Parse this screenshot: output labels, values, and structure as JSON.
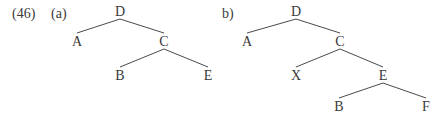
{
  "example": {
    "number": "(46)",
    "panels": [
      {
        "label": "(a)",
        "nodes": [
          {
            "id": "D",
            "label": "D",
            "x": 120,
            "y": 16
          },
          {
            "id": "A",
            "label": "A",
            "x": 77,
            "y": 46
          },
          {
            "id": "C",
            "label": "C",
            "x": 164,
            "y": 46
          },
          {
            "id": "B",
            "label": "B",
            "x": 120,
            "y": 80
          },
          {
            "id": "E",
            "label": "E",
            "x": 208,
            "y": 80
          }
        ],
        "edges": [
          [
            "D",
            "A"
          ],
          [
            "D",
            "C"
          ],
          [
            "C",
            "B"
          ],
          [
            "C",
            "E"
          ]
        ]
      },
      {
        "label": "b)",
        "nodes": [
          {
            "id": "D",
            "label": "D",
            "x": 296,
            "y": 16
          },
          {
            "id": "A",
            "label": "A",
            "x": 247,
            "y": 46
          },
          {
            "id": "C",
            "label": "C",
            "x": 340,
            "y": 46
          },
          {
            "id": "X",
            "label": "X",
            "x": 296,
            "y": 80
          },
          {
            "id": "E",
            "label": "E",
            "x": 383,
            "y": 80
          },
          {
            "id": "B",
            "label": "B",
            "x": 339,
            "y": 111
          },
          {
            "id": "F",
            "label": "F",
            "x": 426,
            "y": 111
          }
        ],
        "edges": [
          [
            "D",
            "A"
          ],
          [
            "D",
            "C"
          ],
          [
            "C",
            "X"
          ],
          [
            "C",
            "E"
          ],
          [
            "E",
            "B"
          ],
          [
            "E",
            "F"
          ]
        ]
      }
    ]
  }
}
